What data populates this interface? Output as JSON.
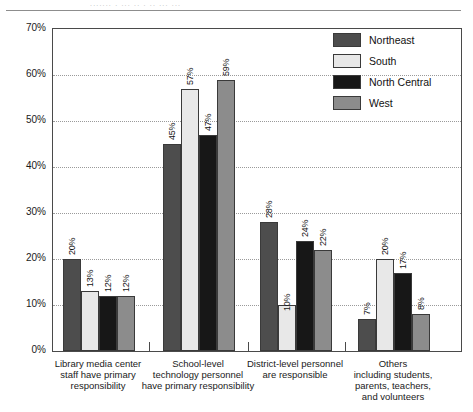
{
  "chart_data": {
    "type": "bar",
    "title": "",
    "xlabel": "",
    "ylabel": "",
    "ylim": [
      0,
      70
    ],
    "y_ticks": [
      "0%",
      "10%",
      "20%",
      "30%",
      "40%",
      "50%",
      "60%",
      "70%"
    ],
    "y_tick_values": [
      0,
      10,
      20,
      30,
      40,
      50,
      60,
      70
    ],
    "grid": true,
    "legend_position": "top-right",
    "value_suffix": "%",
    "value_label_rotation": -90,
    "categories": [
      "Library media center staff have primary responsibility",
      "School-level technology personnel have primary responsibility",
      "District-level personnel are responsible",
      "Others including students, parents, teachers, and volunteers"
    ],
    "category_lines": [
      [
        "Library media center",
        "staff have primary",
        "responsibility"
      ],
      [
        "School-level",
        "technology personnel",
        "have primary responsibility"
      ],
      [
        "District-level personnel",
        "are responsible"
      ],
      [
        "Others",
        "including students,",
        "parents, teachers,",
        "and volunteers"
      ]
    ],
    "series": [
      {
        "name": "Northeast",
        "color": "#4d4d4d",
        "values": [
          20,
          45,
          28,
          7
        ]
      },
      {
        "name": "South",
        "color": "#e8e8e8",
        "values": [
          13,
          57,
          10,
          20
        ]
      },
      {
        "name": "North Central",
        "color": "#171717",
        "values": [
          12,
          47,
          24,
          17
        ]
      },
      {
        "name": "West",
        "color": "#8c8c8c",
        "values": [
          12,
          59,
          22,
          8
        ]
      }
    ],
    "value_labels": [
      [
        "20%",
        "13%",
        "12%",
        "12%"
      ],
      [
        "45%",
        "57%",
        "47%",
        "59%"
      ],
      [
        "28%",
        "10%",
        "24%",
        "22%"
      ],
      [
        "7%",
        "20%",
        "17%",
        "8%"
      ]
    ]
  },
  "legend": {
    "items": [
      {
        "label": "Northeast"
      },
      {
        "label": "South"
      },
      {
        "label": "North Central"
      },
      {
        "label": "West"
      }
    ]
  },
  "title_ghost": "....... . ... .. . .. ... ..."
}
